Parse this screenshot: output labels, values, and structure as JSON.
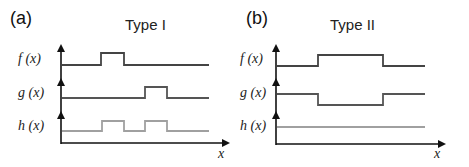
{
  "panels": [
    {
      "id": "a",
      "label": "(a)",
      "title": "Type I",
      "x_axis_label": "x",
      "functions": [
        {
          "name": "f",
          "label": "f (x)",
          "color": "#444444",
          "type": "pulse-up",
          "pulses": [
            [
              101,
              124
            ]
          ]
        },
        {
          "name": "g",
          "label": "g (x)",
          "color": "#555555",
          "type": "pulse-up",
          "pulses": [
            [
              145,
              167
            ]
          ]
        },
        {
          "name": "h",
          "label": "h (x)",
          "color": "#a0a0a0",
          "type": "pulse-up",
          "pulses": [
            [
              102,
              124
            ],
            [
              145,
              167
            ]
          ]
        }
      ]
    },
    {
      "id": "b",
      "label": "(b)",
      "title": "Type II",
      "x_axis_label": "x",
      "functions": [
        {
          "name": "f",
          "label": "f (x)",
          "color": "#444444",
          "type": "pulse-up",
          "pulses": [
            [
              318,
              383
            ]
          ]
        },
        {
          "name": "g",
          "label": "g (x)",
          "color": "#555555",
          "type": "pulse-down",
          "pulses": [
            [
              318,
              383
            ]
          ]
        },
        {
          "name": "h",
          "label": "h (x)",
          "color": "#a0a0a0",
          "type": "flat",
          "pulses": []
        }
      ]
    }
  ],
  "colors": {
    "axis": "#111111",
    "f_line": "#444444",
    "g_line": "#555555",
    "h_line": "#a0a0a0"
  }
}
